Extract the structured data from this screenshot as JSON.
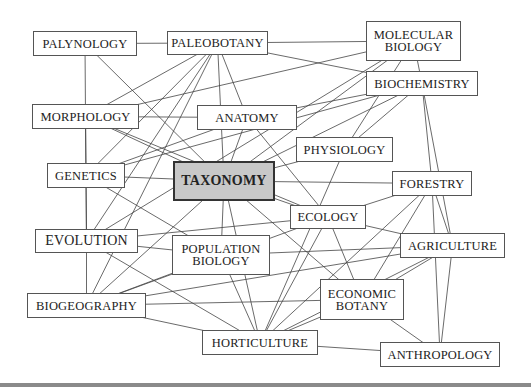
{
  "diagram": {
    "title": "",
    "center_node": "TAXONOMY",
    "nodes": [
      {
        "id": "palynology",
        "label": "PALYNOLOGY",
        "x": 33,
        "y": 31,
        "w": 104,
        "h": 25
      },
      {
        "id": "paleobotany",
        "label": "PALEOBOTANY",
        "x": 167,
        "y": 31,
        "w": 101,
        "h": 24
      },
      {
        "id": "molecular_biology",
        "label": "MOLECULAR\nBIOLOGY",
        "x": 366,
        "y": 21,
        "w": 95,
        "h": 40
      },
      {
        "id": "biochemistry",
        "label": "BIOCHEMISTRY",
        "x": 366,
        "y": 71,
        "w": 112,
        "h": 25
      },
      {
        "id": "morphology",
        "label": "MORPHOLOGY",
        "x": 32,
        "y": 104,
        "w": 107,
        "h": 25
      },
      {
        "id": "anatomy",
        "label": "ANATOMY",
        "x": 197,
        "y": 105,
        "w": 100,
        "h": 25
      },
      {
        "id": "physiology",
        "label": "PHYSIOLOGY",
        "x": 296,
        "y": 137,
        "w": 97,
        "h": 25
      },
      {
        "id": "genetics",
        "label": "GENETICS",
        "x": 47,
        "y": 163,
        "w": 78,
        "h": 25
      },
      {
        "id": "taxonomy",
        "label": "TAXONOMY",
        "x": 173,
        "y": 161,
        "w": 102,
        "h": 40
      },
      {
        "id": "forestry",
        "label": "FORESTRY",
        "x": 392,
        "y": 171,
        "w": 80,
        "h": 25
      },
      {
        "id": "ecology",
        "label": "ECOLOGY",
        "x": 290,
        "y": 205,
        "w": 76,
        "h": 24
      },
      {
        "id": "evolution",
        "label": "EVOLUTION",
        "x": 35,
        "y": 229,
        "w": 103,
        "h": 24
      },
      {
        "id": "population_biology",
        "label": "POPULATION\nBIOLOGY",
        "x": 172,
        "y": 235,
        "w": 98,
        "h": 40
      },
      {
        "id": "agriculture",
        "label": "AGRICULTURE",
        "x": 400,
        "y": 233,
        "w": 105,
        "h": 25
      },
      {
        "id": "biogeography",
        "label": "BIOGEOGRAPHY",
        "x": 27,
        "y": 293,
        "w": 119,
        "h": 25
      },
      {
        "id": "economic_botany",
        "label": "ECONOMIC\nBOTANY",
        "x": 320,
        "y": 279,
        "w": 84,
        "h": 41
      },
      {
        "id": "horticulture",
        "label": "HORTICULTURE",
        "x": 202,
        "y": 330,
        "w": 116,
        "h": 25
      },
      {
        "id": "anthropology",
        "label": "ANTHROPOLOGY",
        "x": 380,
        "y": 342,
        "w": 120,
        "h": 25
      }
    ],
    "edges": [
      [
        "palynology",
        "paleobotany"
      ],
      [
        "palynology",
        "morphology"
      ],
      [
        "palynology",
        "taxonomy"
      ],
      [
        "paleobotany",
        "morphology"
      ],
      [
        "paleobotany",
        "anatomy"
      ],
      [
        "paleobotany",
        "taxonomy"
      ],
      [
        "paleobotany",
        "evolution"
      ],
      [
        "paleobotany",
        "biogeography"
      ],
      [
        "paleobotany",
        "genetics"
      ],
      [
        "paleobotany",
        "biochemistry"
      ],
      [
        "molecular_biology",
        "paleobotany"
      ],
      [
        "molecular_biology",
        "morphology"
      ],
      [
        "molecular_biology",
        "taxonomy"
      ],
      [
        "molecular_biology",
        "biochemistry"
      ],
      [
        "molecular_biology",
        "physiology"
      ],
      [
        "molecular_biology",
        "evolution"
      ],
      [
        "biochemistry",
        "anatomy"
      ],
      [
        "biochemistry",
        "taxonomy"
      ],
      [
        "biochemistry",
        "physiology"
      ],
      [
        "biochemistry",
        "forestry"
      ],
      [
        "biochemistry",
        "agriculture"
      ],
      [
        "biochemistry",
        "genetics"
      ],
      [
        "morphology",
        "anatomy"
      ],
      [
        "morphology",
        "taxonomy"
      ],
      [
        "morphology",
        "genetics"
      ],
      [
        "morphology",
        "evolution"
      ],
      [
        "morphology",
        "ecology"
      ],
      [
        "anatomy",
        "taxonomy"
      ],
      [
        "anatomy",
        "genetics"
      ],
      [
        "anatomy",
        "ecology"
      ],
      [
        "physiology",
        "taxonomy"
      ],
      [
        "physiology",
        "horticulture"
      ],
      [
        "genetics",
        "taxonomy"
      ],
      [
        "genetics",
        "evolution"
      ],
      [
        "genetics",
        "population_biology"
      ],
      [
        "taxonomy",
        "forestry"
      ],
      [
        "taxonomy",
        "ecology"
      ],
      [
        "taxonomy",
        "population_biology"
      ],
      [
        "taxonomy",
        "biogeography"
      ],
      [
        "taxonomy",
        "economic_botany"
      ],
      [
        "taxonomy",
        "horticulture"
      ],
      [
        "forestry",
        "ecology"
      ],
      [
        "forestry",
        "agriculture"
      ],
      [
        "forestry",
        "economic_botany"
      ],
      [
        "forestry",
        "anthropology"
      ],
      [
        "forestry",
        "horticulture"
      ],
      [
        "ecology",
        "evolution"
      ],
      [
        "ecology",
        "agriculture"
      ],
      [
        "ecology",
        "economic_botany"
      ],
      [
        "ecology",
        "horticulture"
      ],
      [
        "ecology",
        "biogeography"
      ],
      [
        "evolution",
        "biogeography"
      ],
      [
        "evolution",
        "horticulture"
      ],
      [
        "evolution",
        "population_biology"
      ],
      [
        "population_biology",
        "biogeography"
      ],
      [
        "population_biology",
        "horticulture"
      ],
      [
        "population_biology",
        "agriculture"
      ],
      [
        "agriculture",
        "economic_botany"
      ],
      [
        "agriculture",
        "anthropology"
      ],
      [
        "agriculture",
        "biogeography"
      ],
      [
        "agriculture",
        "horticulture"
      ],
      [
        "biogeography",
        "economic_botany"
      ],
      [
        "biogeography",
        "horticulture"
      ],
      [
        "economic_botany",
        "horticulture"
      ],
      [
        "economic_botany",
        "anthropology"
      ],
      [
        "horticulture",
        "anthropology"
      ]
    ]
  }
}
